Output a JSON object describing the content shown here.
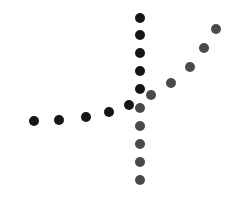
{
  "canvas": {
    "width": 236,
    "height": 197,
    "background": "#ffffff"
  },
  "series": [
    {
      "name": "dark-path",
      "color": "#161616",
      "radius": 5,
      "points": [
        [
          34,
          121
        ],
        [
          59,
          120
        ],
        [
          86,
          117
        ],
        [
          109,
          112
        ],
        [
          129,
          105
        ],
        [
          140,
          89
        ],
        [
          140,
          71
        ],
        [
          140,
          53
        ],
        [
          140,
          35
        ],
        [
          140,
          18
        ]
      ]
    },
    {
      "name": "gray-path",
      "color": "#4a4a4a",
      "radius": 5,
      "points": [
        [
          140,
          180
        ],
        [
          140,
          162
        ],
        [
          140,
          144
        ],
        [
          140,
          126
        ],
        [
          140,
          108
        ],
        [
          151,
          95
        ],
        [
          171,
          83
        ],
        [
          190,
          67
        ],
        [
          204,
          48
        ],
        [
          216,
          29
        ]
      ]
    }
  ]
}
